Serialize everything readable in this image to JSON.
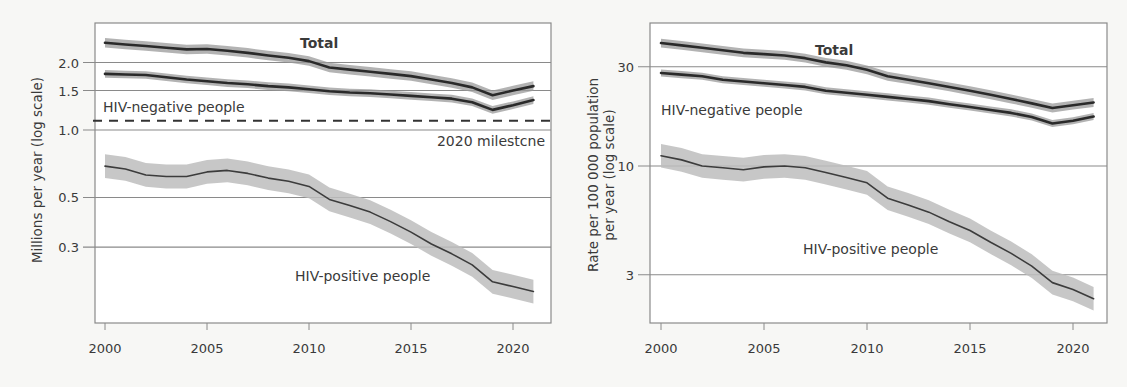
{
  "chart_data": [
    {
      "type": "line",
      "title": "",
      "xlabel": "",
      "ylabel": "Millions per year (log scale)",
      "yscale": "log",
      "ylim": [
        0.14,
        2.7
      ],
      "xlim": [
        1999.5,
        2021.8
      ],
      "yticks": [
        0.3,
        0.5,
        1.0,
        1.5,
        2.0
      ],
      "ytick_labels": [
        "0.3",
        "0.5",
        "1.0",
        "1.5",
        "2.0"
      ],
      "xticks": [
        2000,
        2005,
        2010,
        2015,
        2020
      ],
      "xtick_labels": [
        "2000",
        "2005",
        "2010",
        "2015",
        "2020"
      ],
      "grid": "horizontal at y ticks",
      "x": [
        2000,
        2001,
        2002,
        2003,
        2004,
        2005,
        2006,
        2007,
        2008,
        2009,
        2010,
        2011,
        2012,
        2013,
        2014,
        2015,
        2016,
        2017,
        2018,
        2019,
        2020,
        2021
      ],
      "series": [
        {
          "name": "Total",
          "values": [
            2.45,
            2.41,
            2.37,
            2.33,
            2.29,
            2.3,
            2.26,
            2.21,
            2.15,
            2.1,
            2.03,
            1.9,
            1.86,
            1.82,
            1.78,
            1.74,
            1.68,
            1.62,
            1.55,
            1.43,
            1.5,
            1.57
          ],
          "band": 0.05
        },
        {
          "name": "HIV-negative people",
          "values": [
            1.78,
            1.77,
            1.76,
            1.72,
            1.68,
            1.65,
            1.62,
            1.6,
            1.57,
            1.55,
            1.52,
            1.49,
            1.47,
            1.46,
            1.44,
            1.42,
            1.4,
            1.38,
            1.33,
            1.23,
            1.29,
            1.36
          ],
          "band": 0.04
        },
        {
          "name": "HIV-positive people",
          "values": [
            0.69,
            0.67,
            0.63,
            0.62,
            0.62,
            0.65,
            0.66,
            0.64,
            0.61,
            0.59,
            0.56,
            0.49,
            0.46,
            0.43,
            0.39,
            0.35,
            0.31,
            0.28,
            0.25,
            0.21,
            0.2,
            0.19
          ],
          "band": 0.13
        }
      ],
      "reference_lines": [
        {
          "label": "2020 milestone",
          "value": 1.1,
          "style": "dashed"
        }
      ],
      "annotations": [
        "Total",
        "HIV-negative people",
        "HIV-positive people",
        "2020 milestcne"
      ]
    },
    {
      "type": "line",
      "title": "",
      "xlabel": "",
      "ylabel": "Rate per 100 000 population per year (log scale)",
      "yscale": "log",
      "ylim": [
        1.9,
        44
      ],
      "xlim": [
        1999.5,
        2021.8
      ],
      "yticks": [
        3,
        10,
        30
      ],
      "ytick_labels": [
        "3",
        "10",
        "30"
      ],
      "xticks": [
        2000,
        2005,
        2010,
        2015,
        2020
      ],
      "xtick_labels": [
        "2000",
        "2005",
        "2010",
        "2015",
        "2020"
      ],
      "grid": "horizontal at y ticks",
      "x": [
        2000,
        2001,
        2002,
        2003,
        2004,
        2005,
        2006,
        2007,
        2008,
        2009,
        2010,
        2011,
        2012,
        2013,
        2014,
        2015,
        2016,
        2017,
        2018,
        2019,
        2020,
        2021
      ],
      "series": [
        {
          "name": "Total",
          "values": [
            39,
            38,
            37,
            36,
            35,
            34.5,
            34,
            33,
            31.5,
            30.5,
            29,
            27,
            26,
            25,
            24,
            23,
            22,
            21,
            20,
            19,
            19.6,
            20.2
          ],
          "band": 0.05
        },
        {
          "name": "HIV-negative people",
          "values": [
            28,
            27.5,
            27,
            26,
            25.5,
            25,
            24.5,
            24,
            23,
            22.5,
            22,
            21.5,
            21,
            20.5,
            19.8,
            19.2,
            18.6,
            18,
            17.2,
            16,
            16.5,
            17.3
          ],
          "band": 0.04
        },
        {
          "name": "HIV-positive people",
          "values": [
            11.2,
            10.7,
            10.0,
            9.8,
            9.6,
            9.9,
            10.0,
            9.8,
            9.3,
            8.8,
            8.3,
            7.0,
            6.5,
            6.0,
            5.4,
            4.9,
            4.3,
            3.8,
            3.3,
            2.75,
            2.55,
            2.3
          ],
          "band": 0.14
        }
      ],
      "annotations": [
        "Total",
        "HIV-negative people",
        "HIV-positive people"
      ]
    }
  ],
  "left": {
    "ylabel": "Millions per year (log scale)",
    "labels": {
      "total": "Total",
      "negative": "HIV-negative people",
      "positive": "HIV-positive people",
      "milestone": "2020 milestcne"
    }
  },
  "right": {
    "ylabel_line1": "Rate per 100 000 population",
    "ylabel_line2": "per year (log scale)",
    "labels": {
      "total": "Total",
      "negative": "HIV-negative people",
      "positive": "HIV-positive people"
    }
  }
}
